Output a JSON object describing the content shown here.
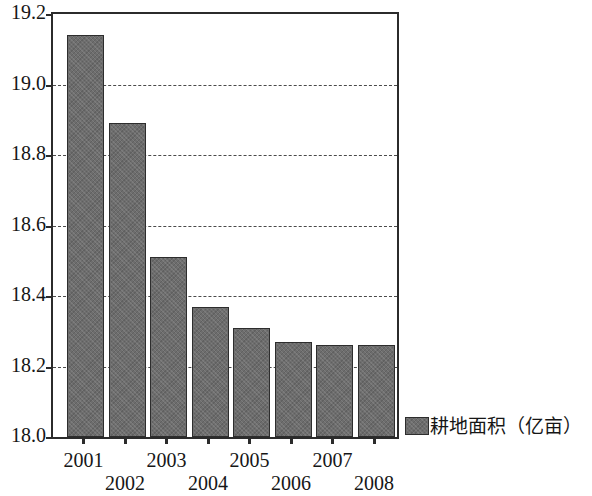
{
  "chart_data": {
    "type": "bar",
    "title": "",
    "subtitle": "",
    "xlabel": "",
    "ylabel": "",
    "categories": [
      "2001",
      "2002",
      "2003",
      "2004",
      "2005",
      "2006",
      "2007",
      "2008"
    ],
    "values": [
      19.14,
      18.89,
      18.51,
      18.37,
      18.31,
      18.27,
      18.26,
      18.26
    ],
    "series": [
      {
        "name": "耕地面积（亿亩）",
        "values": [
          19.14,
          18.89,
          18.51,
          18.37,
          18.31,
          18.27,
          18.26,
          18.26
        ],
        "color": "#6d6d6d"
      }
    ],
    "ylim": [
      18.0,
      19.2
    ],
    "ytick_values": [
      18.0,
      18.2,
      18.4,
      18.6,
      18.8,
      19.0,
      19.2
    ],
    "ytick_labels": [
      "18.0",
      "18.2",
      "18.4",
      "18.6",
      "18.8",
      "19.0",
      "19.2"
    ],
    "xtick_labels": [
      "2001",
      "2002",
      "2003",
      "2004",
      "2005",
      "2006",
      "2007",
      "2008"
    ],
    "grid": true,
    "grid_axis": "y",
    "grid_style": "dashed",
    "legend": {
      "position": "right",
      "entries": [
        {
          "label": "耕地面积（亿亩）",
          "color": "#6d6d6d"
        }
      ]
    },
    "axis_color": "#2b2b2b",
    "background": "#ffffff"
  }
}
